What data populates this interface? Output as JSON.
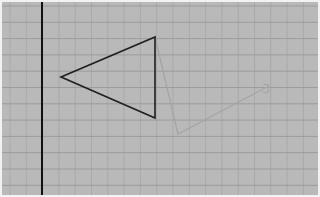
{
  "viewport": {
    "width": 320,
    "height": 197
  },
  "colors": {
    "background": "#b9b9b9",
    "border": "#f2f2f2",
    "grid_minor": "#a9a9a9",
    "grid_major": "#9c9c9c",
    "axis": "#111111",
    "triangle": "#1e1e1e",
    "ghost": "#a4a4a4"
  },
  "grid": {
    "spacing": 16.3,
    "origin_x": 10,
    "origin_y": 6
  },
  "axis": {
    "x": 42
  },
  "triangle": {
    "vertices": [
      [
        61,
        77
      ],
      [
        155,
        37
      ],
      [
        155,
        118
      ]
    ]
  },
  "ghost_path": {
    "points": [
      [
        155,
        37
      ],
      [
        178,
        134
      ],
      [
        265,
        88
      ]
    ]
  },
  "label": {
    "text": "3",
    "x": 262,
    "y": 93
  }
}
